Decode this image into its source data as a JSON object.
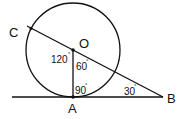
{
  "diagram": {
    "type": "geometry",
    "stroke_color": "#111111",
    "points": {
      "O": {
        "label": "O"
      },
      "A": {
        "label": "A"
      },
      "B": {
        "label": "B"
      },
      "C": {
        "label": "C"
      }
    },
    "angles": {
      "AOC": {
        "value": "120",
        "unit": "°"
      },
      "AOB": {
        "value": "60",
        "unit": "°"
      },
      "OAB": {
        "value": "90",
        "unit": "°"
      },
      "ABO": {
        "value": "30",
        "unit": "°"
      }
    }
  }
}
